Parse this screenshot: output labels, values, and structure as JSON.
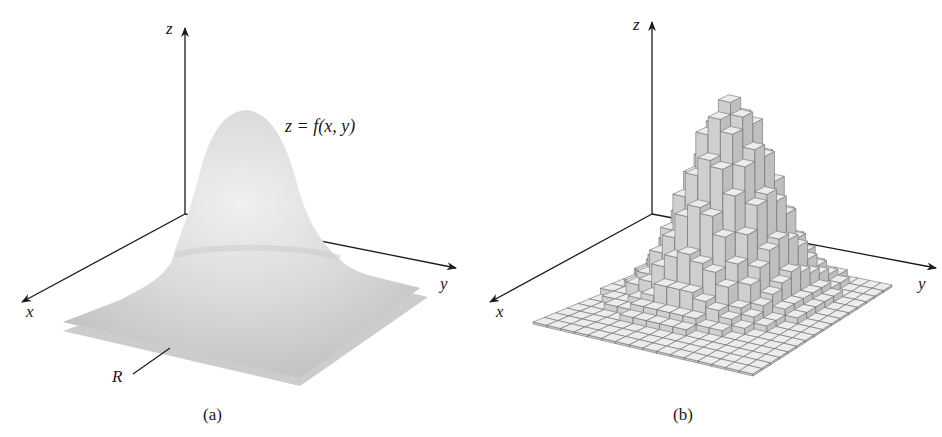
{
  "figure": {
    "panels": [
      {
        "id": "a",
        "caption": "(a)",
        "axes": {
          "x": "x",
          "y": "y",
          "z": "z"
        },
        "surface_label": "z = f(x, y)",
        "region_label": "R",
        "description": "Smooth bell-shaped surface z = f(x, y) over a square region R in the xy-plane"
      },
      {
        "id": "b",
        "caption": "(b)",
        "axes": {
          "x": "x",
          "y": "y",
          "z": "z"
        },
        "description": "Approximation of the volume under the surface by rectangular columns over a grid partition of R"
      }
    ],
    "colors": {
      "axis": "#1a1a1a",
      "surface_fill": "#d9d9d9",
      "surface_shade": "#bdbdbd",
      "region_fill": "#cfcfcf",
      "box_top": "#ececec",
      "box_side": "#c8c8c8",
      "box_edge": "#6e6e6e"
    }
  }
}
